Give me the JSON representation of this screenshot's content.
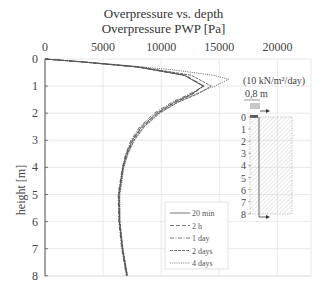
{
  "chart_data": {
    "type": "line",
    "title": "Overpressure vs. depth",
    "subtitle": "Overpressure  PWP [Pa]",
    "xlabel": "Overpressure  PWP [Pa]",
    "ylabel": "height [m]",
    "x_axis_position": "top",
    "xlim": [
      0,
      23000
    ],
    "ylim": [
      0,
      8
    ],
    "y_inverted": true,
    "xticks": [
      0,
      5000,
      10000,
      15000,
      20000
    ],
    "yticks": [
      0,
      1,
      2,
      3,
      4,
      5,
      6,
      7,
      8
    ],
    "grid": true,
    "legend_position": "lower center-right",
    "series": [
      {
        "name": "20 min",
        "style": "solid",
        "depth": [
          0,
          0.1,
          0.3,
          0.6,
          1.0,
          1.3,
          1.6,
          2.0,
          2.5,
          3.0,
          3.5,
          4.0,
          5.0,
          6.0,
          7.0,
          8.0
        ],
        "values": [
          0,
          3000,
          8000,
          12000,
          13600,
          12600,
          11100,
          9600,
          8300,
          7500,
          7000,
          6700,
          6350,
          6400,
          6650,
          7050
        ]
      },
      {
        "name": "2 h",
        "style": "dashed",
        "depth": [
          0,
          0.1,
          0.3,
          0.6,
          1.0,
          1.3,
          1.6,
          2.0,
          2.5,
          3.0,
          3.5,
          4.0,
          5.0,
          6.0,
          7.0,
          8.0
        ],
        "values": [
          0,
          3000,
          8000,
          12000,
          13650,
          12700,
          11200,
          9700,
          8400,
          7550,
          7050,
          6700,
          6350,
          6400,
          6650,
          7050
        ]
      },
      {
        "name": "1 day",
        "style": "dashdot",
        "depth": [
          0,
          0.1,
          0.3,
          0.6,
          1.0,
          1.3,
          1.6,
          2.0,
          2.5,
          3.0,
          3.5,
          4.0,
          5.0,
          6.0,
          7.0,
          8.0
        ],
        "values": [
          0,
          3000,
          8100,
          12100,
          13700,
          12400,
          10900,
          9400,
          8150,
          7400,
          6950,
          6650,
          6300,
          6350,
          6600,
          7000
        ]
      },
      {
        "name": "2 days",
        "style": "longdash",
        "depth": [
          0,
          0.1,
          0.3,
          0.6,
          1.0,
          1.3,
          1.6,
          2.0,
          2.5,
          3.0,
          3.5,
          4.0,
          5.0,
          6.0,
          7.0,
          8.0
        ],
        "values": [
          0,
          3100,
          8300,
          12600,
          14300,
          13100,
          11400,
          9800,
          8500,
          7650,
          7100,
          6750,
          6400,
          6450,
          6700,
          7100
        ]
      },
      {
        "name": "4 days",
        "style": "dotted",
        "depth": [
          0,
          0.2,
          0.4,
          0.6,
          0.75,
          1.0,
          1.3,
          1.6,
          2.0,
          2.5,
          3.0,
          3.5,
          4.0,
          5.0,
          6.0,
          7.0,
          8.0
        ],
        "values": [
          0,
          6000,
          11000,
          14500,
          15800,
          14600,
          12900,
          11400,
          9900,
          8550,
          7700,
          7150,
          6800,
          6450,
          6450,
          6700,
          7100
        ]
      }
    ]
  },
  "figure": {
    "title": "Overpressure vs. depth",
    "subtitle": "Overpressure  PWP [Pa]",
    "ylabel": "height [m]",
    "xticks": [
      "0",
      "5000",
      "10000",
      "15000",
      "20000"
    ],
    "yticks": [
      "0",
      "1",
      "2",
      "3",
      "4",
      "5",
      "6",
      "7",
      "8"
    ],
    "legend": [
      "20 min",
      "2 h",
      "1 day",
      "2 days",
      "4 days"
    ],
    "inset": {
      "load_label": "(10 kN/m²/day)",
      "width_label": "0,8 m",
      "depth_ticks": [
        "0",
        "1",
        "2",
        "3",
        "4",
        "5",
        "6",
        "7",
        "8"
      ]
    }
  }
}
